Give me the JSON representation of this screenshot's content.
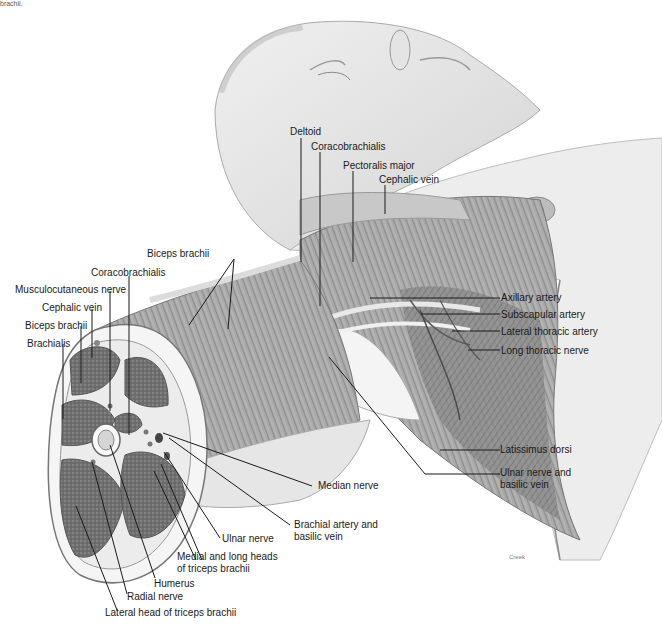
{
  "figure": {
    "clipped_caption": "brachii.",
    "credit": "Creek"
  },
  "labels": {
    "deltoid": "Deltoid",
    "coracobrachialis_top": "Coracobrachialis",
    "pectoralis_major": "Pectoralis major",
    "cephalic_vein_top": "Cephalic vein",
    "biceps_brachii_top": "Biceps brachii",
    "coracobrachialis_left": "Coracobrachialis",
    "musculocutaneous_nerve": "Musculocutaneous nerve",
    "cephalic_vein_left": "Cephalic vein",
    "biceps_brachii_left": "Biceps brachii",
    "brachialis": "Brachialis",
    "axillary_artery": "Axillary artery",
    "subscapular_artery": "Subscapular artery",
    "lateral_thoracic_artery": "Lateral thoracic artery",
    "long_thoracic_nerve": "Long thoracic nerve",
    "latissimus_dorsi": "Latissimus dorsi",
    "ulnar_nerve_and_basilic_vein": "Ulnar nerve and\nbasilic vein",
    "median_nerve": "Median nerve",
    "brachial_artery_and_basilic_vein": "Brachial artery and\nbasilic vein",
    "ulnar_nerve": "Ulnar nerve",
    "medial_and_long_heads": "Medial and long heads\nof triceps brachii",
    "humerus": "Humerus",
    "radial_nerve": "Radial nerve",
    "lateral_head_triceps": "Lateral head of triceps brachii"
  },
  "colors": {
    "background": "#ffffff",
    "leader_line": "#1a1a1a",
    "muscle_dark": "#6e6e6e",
    "muscle_mid": "#9a9a9a",
    "skin": "#d9d9d9",
    "skin_light": "#ececec"
  }
}
